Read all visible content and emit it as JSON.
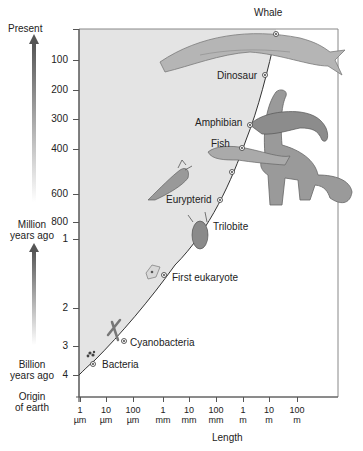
{
  "y_axis": {
    "top_label": "Present",
    "ticks_million": [
      "100",
      "200",
      "300",
      "400",
      "600",
      "800"
    ],
    "ticks_billion": [
      "1",
      "2",
      "3",
      "4"
    ],
    "million_label": [
      "Million",
      "years ago"
    ],
    "billion_label": [
      "Billion",
      "years ago"
    ],
    "origin_label": [
      "Origin",
      "of earth"
    ]
  },
  "x_axis": {
    "title": "Length",
    "ticks": [
      {
        "value": "1",
        "unit": "µm"
      },
      {
        "value": "10",
        "unit": "µm"
      },
      {
        "value": "100",
        "unit": "µm"
      },
      {
        "value": "1",
        "unit": "mm"
      },
      {
        "value": "10",
        "unit": "mm"
      },
      {
        "value": "100",
        "unit": "mm"
      },
      {
        "value": "1",
        "unit": "m"
      },
      {
        "value": "10",
        "unit": "m"
      },
      {
        "value": "100",
        "unit": "m"
      }
    ]
  },
  "organisms": [
    {
      "name": "Whale"
    },
    {
      "name": "Dinosaur"
    },
    {
      "name": "Amphibian"
    },
    {
      "name": "Fish"
    },
    {
      "name": "Eurypterid"
    },
    {
      "name": "Trilobite"
    },
    {
      "name": "First eukaryote"
    },
    {
      "name": "Cyanobacteria"
    },
    {
      "name": "Bacteria"
    }
  ],
  "colors": {
    "shaded_region": "#e3e3e3",
    "axis": "#555555",
    "curve": "#333333",
    "arrow_dark": "#555555"
  }
}
